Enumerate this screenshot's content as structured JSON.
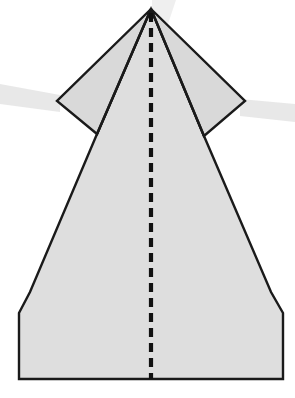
{
  "document": {
    "title": "Paper Airplane Fold Step Diagram",
    "kind": "origami-fold-diagram",
    "width": 295,
    "height": 398,
    "background_color": "#ffffff"
  },
  "style": {
    "paper_fill": "#dedede",
    "paper_fill_flap": "#d9d9d9",
    "outline_color": "#1a1a1a",
    "outline_width": 2.4,
    "fold_line_color": "#111111",
    "fold_line_width": 4.2,
    "fold_dash_on": 9,
    "fold_dash_off": 6,
    "scan_band_color": "#e4e4e4",
    "scan_band_opacity": 0.85
  },
  "figure": {
    "apex_label": "nose point",
    "apex": {
      "x": 151,
      "y": 9
    },
    "body_outline_points": "151,9 204,136 271,292 283,313 283,379 19,379 19,313 30,292 97,134",
    "left_flap_points": "151,9 57,101 97,134",
    "right_flap_points": "151,9 245,101 204,136",
    "left_wing_tip": {
      "x": 57,
      "y": 101
    },
    "right_wing_tip": {
      "x": 245,
      "y": 101
    },
    "left_flap_junction": {
      "x": 97,
      "y": 134
    },
    "right_flap_junction": {
      "x": 204,
      "y": 136
    },
    "left_chamfer_top": {
      "x": 30,
      "y": 292
    },
    "left_chamfer_bottom": {
      "x": 19,
      "y": 313
    },
    "right_chamfer_top": {
      "x": 271,
      "y": 292
    },
    "right_chamfer_bottom": {
      "x": 283,
      "y": 313
    },
    "bottom_edge_y": 379,
    "bottom_edge_left_x": 19,
    "bottom_edge_right_x": 283
  },
  "center_fold": {
    "label": "valley fold along center line",
    "line_type": "dashed",
    "x": 151,
    "y_start": 13,
    "y_end": 379
  },
  "scan_bands": [
    {
      "name": "left-band",
      "points": "0,84 60,95 60,112 0,104"
    },
    {
      "name": "right-band",
      "points": "240,99 295,104 295,122 240,116"
    },
    {
      "name": "top-band",
      "points": "152,0 176,0 166,30 152,26"
    }
  ]
}
